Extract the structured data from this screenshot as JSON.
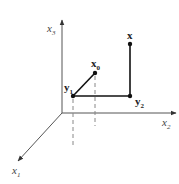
{
  "diagram": {
    "type": "3d-coordinate-projection",
    "origin": {
      "x": 62,
      "y": 113
    },
    "axes": [
      {
        "id": "x3",
        "label": "x",
        "subscript": "3",
        "end": {
          "x": 62,
          "y": 20
        },
        "label_pos": {
          "x": 47,
          "y": 32
        }
      },
      {
        "id": "x2",
        "label": "x",
        "subscript": "2",
        "end": {
          "x": 176,
          "y": 113
        },
        "label_pos": {
          "x": 162,
          "y": 126
        }
      },
      {
        "id": "x1",
        "label": "x",
        "subscript": "1",
        "end": {
          "x": 18,
          "y": 161
        },
        "label_pos": {
          "x": 12,
          "y": 174
        }
      }
    ],
    "points": [
      {
        "id": "y1",
        "label": "y",
        "subscript": "1",
        "pos": {
          "x": 73,
          "y": 96
        },
        "label_pos": {
          "x": 64,
          "y": 91
        }
      },
      {
        "id": "x0",
        "label": "x",
        "subscript": "0",
        "pos": {
          "x": 95,
          "y": 73
        },
        "label_pos": {
          "x": 91,
          "y": 67
        }
      },
      {
        "id": "y2",
        "label": "y",
        "subscript": "2",
        "pos": {
          "x": 130,
          "y": 96
        },
        "label_pos": {
          "x": 135,
          "y": 105
        }
      },
      {
        "id": "x",
        "label": "x",
        "subscript": "",
        "pos": {
          "x": 130,
          "y": 44
        },
        "label_pos": {
          "x": 127,
          "y": 39
        }
      }
    ],
    "segments": [
      {
        "from": "y1",
        "to": "x0",
        "style": "solid"
      },
      {
        "from": "y1",
        "to": "y2",
        "style": "solid"
      },
      {
        "from": "y2",
        "to": "x",
        "style": "solid"
      }
    ],
    "dashed_projections": [
      {
        "x": 73,
        "y_start": 99,
        "y_end": 148
      },
      {
        "x": 95,
        "y_start": 76,
        "y_end": 126
      }
    ],
    "colors": {
      "axis": "#555555",
      "segment": "#111111",
      "dashed": "#888888",
      "point": "#111111"
    }
  }
}
